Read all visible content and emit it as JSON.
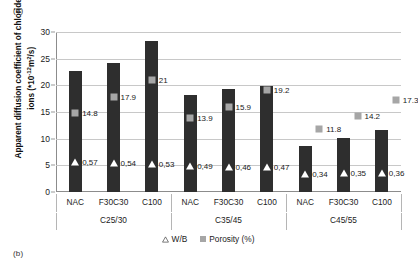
{
  "panels": {
    "top": "(a)",
    "bottom": "(b)"
  },
  "chart_data": {
    "type": "bar",
    "title": "",
    "xlabel": "",
    "ylabel": "Apparent  diffusion coefficient of chloride ions (*10-12m2/s)",
    "ylabel_prefix": "Apparent  diffusion coefficient of chloride ions (*10",
    "ylabel_exp": "-12",
    "ylabel_mid": "m",
    "ylabel_exp2": "2",
    "ylabel_suffix": "/s)",
    "ylim": [
      0,
      30
    ],
    "yticks": [
      0,
      5,
      10,
      15,
      20,
      25,
      30
    ],
    "grid": true,
    "legend_position": "bottom",
    "categories": [
      "NAC",
      "F30C30",
      "C100",
      "NAC",
      "F30C30",
      "C100",
      "NAC",
      "F30C30",
      "C100"
    ],
    "groups": [
      "C25/30",
      "C35/45",
      "C45/55"
    ],
    "series": [
      {
        "name": "Apparent diffusion coefficient",
        "type": "bar",
        "color": "#2e2e2e",
        "values": [
          22.6,
          24.2,
          28.3,
          18.2,
          19.4,
          19.9,
          8.6,
          10.1,
          11.7
        ]
      },
      {
        "name": "Porosity (%)",
        "type": "marker-square",
        "color": "#a6a6a6",
        "values": [
          14.8,
          17.9,
          21,
          13.9,
          15.9,
          19.2,
          11.8,
          14.2,
          17.3
        ],
        "labels": [
          "14.8",
          "17.9",
          "21",
          "13.9",
          "15.9",
          "19.2",
          "11.8",
          "14.2",
          "17.3"
        ]
      },
      {
        "name": "W/B",
        "type": "marker-triangle",
        "color": "#ffffff",
        "values": [
          5.7,
          5.4,
          5.3,
          4.9,
          4.6,
          4.7,
          3.4,
          3.5,
          3.6
        ],
        "labels": [
          "0,57",
          "0,54",
          "0,53",
          "0,49",
          "0,46",
          "0,47",
          "0,34",
          "0,35",
          "0,36"
        ]
      }
    ],
    "legend": [
      {
        "label": "W/B",
        "marker": "triangle-outline-icon",
        "color": "#ffffff"
      },
      {
        "label": "Porosity (%)",
        "marker": "square-icon",
        "color": "#a6a6a6"
      }
    ]
  }
}
